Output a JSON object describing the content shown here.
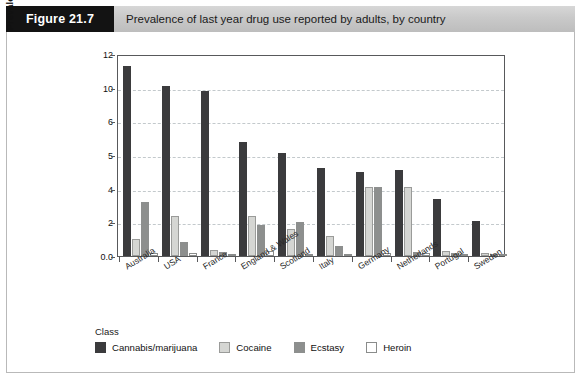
{
  "figure": {
    "number_label": "Figure 21.7",
    "caption": "Prevalence of last year drug use reported by adults, by country"
  },
  "legend": {
    "title": "Class",
    "items": [
      {
        "label": "Cannabis/marijuana",
        "color": "#3b3b3d"
      },
      {
        "label": "Cocaine",
        "color": "#d5d6d3"
      },
      {
        "label": "Ecstasy",
        "color": "#8d8f8e"
      },
      {
        "label": "Heroin",
        "color": "#ffffff"
      }
    ]
  },
  "chart_data": {
    "type": "bar",
    "title": "Prevalence of last year drug use reported by adults, by country",
    "xlabel": "",
    "ylabel": "Prevalence of use in the past year (%)",
    "ylim": [
      0,
      12
    ],
    "ytick_labels": [
      "12",
      "10",
      "6",
      "5",
      "4",
      "2",
      "0.0"
    ],
    "ytick_values": [
      12,
      10,
      8,
      6,
      4,
      2,
      0
    ],
    "grid": true,
    "legend_position": "bottom-left",
    "categories": [
      "Australia",
      "USA",
      "France",
      "England & Wales",
      "Scotland",
      "Italy",
      "Germany",
      "Netherlands",
      "Portugal",
      "Sweden"
    ],
    "series": [
      {
        "name": "Cannabis/marijuana",
        "color": "#3b3b3d",
        "values": [
          11.3,
          10.1,
          9.8,
          6.8,
          6.1,
          5.2,
          5.0,
          5.1,
          3.4,
          2.1
        ]
      },
      {
        "name": "Cocaine",
        "color": "#d5d6d3",
        "values": [
          1.0,
          2.35,
          0.35,
          2.4,
          1.6,
          1.2,
          4.1,
          4.1,
          0.3,
          0.15
        ]
      },
      {
        "name": "Ecstasy",
        "color": "#8d8f8e",
        "values": [
          3.2,
          0.85,
          0.25,
          1.85,
          2.0,
          0.6,
          4.1,
          0.25,
          0.2,
          0.1
        ]
      },
      {
        "name": "Heroin",
        "color": "#ffffff",
        "values": [
          0.2,
          0.2,
          0.1,
          0.3,
          0.1,
          0.1,
          0.15,
          0.15,
          0.1,
          0.1
        ]
      }
    ]
  }
}
